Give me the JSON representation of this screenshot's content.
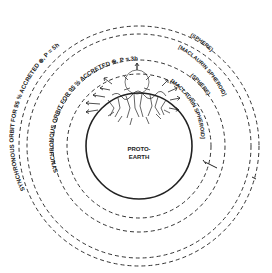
{
  "diagram": {
    "center": {
      "x": 139,
      "y": 146
    },
    "protoearth": {
      "label_line1": "PROTO-",
      "label_line2": "EARTH",
      "radius": 53
    },
    "orbits": [
      {
        "name": "inner-sphere-orbit",
        "radius": 72
      },
      {
        "name": "inner-spheroid-orbit",
        "radius": 86
      },
      {
        "name": "outer-sphere-orbit",
        "radius": 112
      },
      {
        "name": "outer-spheroid-orbit",
        "radius": 120
      }
    ],
    "labels": {
      "outer_orbit": "SYNCHRONOUS ORBIT FOR 95 % ACCRETED ⊕,  P = 5h",
      "outer_sphere": "(SPHERE)",
      "outer_spheroid": "[MACLAURIN SPHEROID]",
      "inner_orbit": "SYNCHRONOUS ORBIT FOR 95 % ACCRETED ⊕,  P = 3h",
      "inner_sphere": "(SPHERE)",
      "inner_spheroid": "[MACLAURIN SPHEROID]"
    },
    "colors": {
      "ink": "#222222",
      "background": "#ffffff"
    }
  }
}
